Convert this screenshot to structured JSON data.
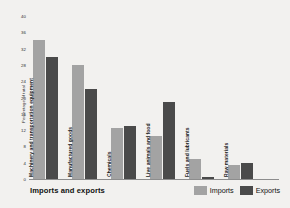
{
  "chart_data": {
    "type": "bar",
    "title": "Imports and exports",
    "xlabel": "",
    "ylabel": "Percentage of total",
    "ylim": [
      0,
      40
    ],
    "yticks": [
      40,
      36,
      32,
      28,
      24,
      20,
      16,
      12,
      8,
      4,
      0
    ],
    "grid": false,
    "legend_position": "bottom-right",
    "categories": [
      "Machinery and transportation equipment",
      "Manufactured goods",
      "Chemicals",
      "Live animals and food",
      "Fuels and lubricants",
      "Raw materials"
    ],
    "series": [
      {
        "name": "Imports",
        "color": "#a3a3a3",
        "values": [
          34,
          28,
          12.5,
          10.5,
          5,
          3.5
        ]
      },
      {
        "name": "Exports",
        "color": "#4a4a4a",
        "values": [
          30,
          22,
          13,
          19,
          0.5,
          4
        ]
      }
    ]
  },
  "colors": {
    "background": "#f2f1ef",
    "axis": "#8d8d8d",
    "imports": "#a3a3a3",
    "exports": "#4a4a4a",
    "text": "#1d1d1d"
  }
}
